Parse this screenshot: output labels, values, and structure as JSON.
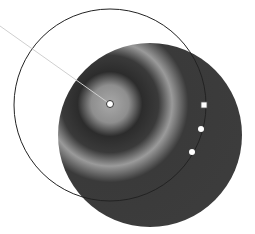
{
  "figure": {
    "colors": {
      "background": "#ffffff",
      "gradient_stops": [
        "#a9a9a9",
        "#8f8f8f",
        "#2e2e2e",
        "#9a9a9a",
        "#3a3a3a",
        "#3d3d3d"
      ],
      "ring_stroke": "#222222",
      "leader_line": "#c8c8c8",
      "handle_fill": "#ffffff"
    },
    "gradient_center": {
      "x": 110,
      "y": 104
    },
    "shape": {
      "cx": 150,
      "cy": 135,
      "r": 92
    },
    "annotator_ring": {
      "cx": 110,
      "cy": 105,
      "r": 96
    },
    "handles": [
      {
        "type": "square",
        "x": 204,
        "y": 105
      },
      {
        "type": "circle",
        "x": 201,
        "y": 129
      },
      {
        "type": "circle",
        "x": 192,
        "y": 152
      }
    ],
    "leader": {
      "x1": 0,
      "y1": 26,
      "x2": 110,
      "y2": 104
    }
  }
}
